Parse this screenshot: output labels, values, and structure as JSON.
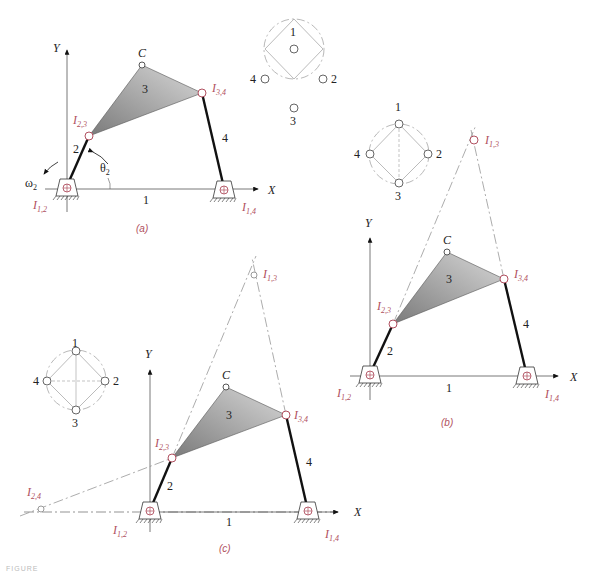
{
  "figure": {
    "caption_partial": "FIGURE",
    "colors": {
      "instant_center": "#b05060",
      "link": "#111111",
      "coupler_fill": "#9a9a9a",
      "construction": "#888888"
    }
  },
  "panels": [
    {
      "id": "a",
      "caption": "(a)",
      "axes": {
        "x": "X",
        "y": "Y"
      },
      "links": {
        "ground": "1",
        "crank": "2",
        "coupler": "3",
        "rocker": "4"
      },
      "point_c": "C",
      "angle": "θ2",
      "omega": "ω2",
      "instant_centers": [
        "I1,2",
        "I2,3",
        "I3,4",
        "I1,4"
      ],
      "linear_graph": {
        "nodes": [
          "1",
          "2",
          "3",
          "4"
        ]
      }
    },
    {
      "id": "b",
      "caption": "(b)",
      "axes": {
        "x": "X",
        "y": "Y"
      },
      "links": {
        "ground": "1",
        "crank": "2",
        "coupler": "3",
        "rocker": "4"
      },
      "point_c": "C",
      "instant_centers": [
        "I1,2",
        "I2,3",
        "I3,4",
        "I1,4",
        "I1,3"
      ],
      "linear_graph": {
        "nodes": [
          "1",
          "2",
          "3",
          "4"
        ]
      }
    },
    {
      "id": "c",
      "caption": "(c)",
      "axes": {
        "x": "X",
        "y": "Y"
      },
      "links": {
        "ground": "1",
        "crank": "2",
        "coupler": "3",
        "rocker": "4"
      },
      "point_c": "C",
      "instant_centers": [
        "I1,2",
        "I2,3",
        "I3,4",
        "I1,4",
        "I1,3",
        "I2,4"
      ],
      "linear_graph": {
        "nodes": [
          "1",
          "2",
          "3",
          "4"
        ]
      }
    }
  ],
  "labels": {
    "I12": {
      "main": "I",
      "sub": "1,2"
    },
    "I23": {
      "main": "I",
      "sub": "2,3"
    },
    "I34": {
      "main": "I",
      "sub": "3,4"
    },
    "I14": {
      "main": "I",
      "sub": "1,4"
    },
    "I13": {
      "main": "I",
      "sub": "1,3"
    },
    "I24": {
      "main": "I",
      "sub": "2,4"
    },
    "theta": {
      "main": "θ",
      "sub": "2"
    },
    "omega": {
      "main": "ω",
      "sub": "2"
    }
  }
}
